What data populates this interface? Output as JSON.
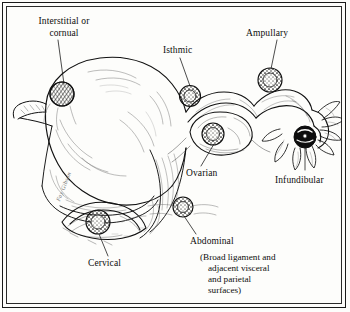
{
  "figure": {
    "medium": "pen-and-ink anatomical line drawing",
    "frame": {
      "style": "double-rule rectangle",
      "color": "#1a1a1a"
    },
    "ink_color": "#111111",
    "paper_color": "#fdfdfb",
    "signature": "Fay Gibson"
  },
  "labels": {
    "interstitial": "Interstitial or\ncornual",
    "isthmic": "Isthmic",
    "ampullary": "Ampullary",
    "infundibular": "Infundibular",
    "ovarian": "Ovarian",
    "abdominal": "Abdominal",
    "cervical": "Cervical"
  },
  "note": {
    "line1": "(Broad ligament and",
    "line2": "adjacent visceral",
    "line3": "and parietal",
    "line4": "surfaces)"
  },
  "sites": [
    {
      "key": "interstitial",
      "label": "Interstitial or cornual",
      "marker_style": "cross-hatched circle",
      "marker": {
        "cx": 62,
        "cy": 94,
        "r": 12
      },
      "leader": {
        "x1": 58,
        "y1": 40,
        "x2": 64,
        "y2": 84
      }
    },
    {
      "key": "isthmic",
      "label": "Isthmic",
      "marker_style": "stippled ring",
      "marker": {
        "cx": 190,
        "cy": 96,
        "r": 10.5
      },
      "leader": {
        "x1": 180,
        "y1": 58,
        "x2": 190,
        "y2": 86
      }
    },
    {
      "key": "ampullary",
      "label": "Ampullary",
      "marker_style": "stippled ring",
      "marker": {
        "cx": 270,
        "cy": 80,
        "r": 12
      },
      "leader": {
        "x1": 277,
        "y1": 40,
        "x2": 271,
        "y2": 69
      }
    },
    {
      "key": "infundibular",
      "label": "Infundibular",
      "marker_style": "solid dark blot",
      "marker": {
        "cx": 305,
        "cy": 137,
        "r": 11
      },
      "leader": {
        "x1": 305,
        "y1": 148,
        "x2": 305,
        "y2": 170
      }
    },
    {
      "key": "ovarian",
      "label": "Ovarian",
      "marker_style": "stippled ring",
      "marker": {
        "cx": 213,
        "cy": 134,
        "r": 11
      },
      "leader": {
        "x1": 214,
        "y1": 144,
        "x2": 201,
        "y2": 166
      }
    },
    {
      "key": "abdominal",
      "label": "Abdominal",
      "marker_style": "stippled ring",
      "marker": {
        "cx": 183,
        "cy": 207,
        "r": 10
      },
      "leader": {
        "x1": 184,
        "y1": 216,
        "x2": 196,
        "y2": 234
      }
    },
    {
      "key": "cervical",
      "label": "Cervical",
      "marker_style": "stippled ring",
      "marker": {
        "cx": 98,
        "cy": 222,
        "r": 12
      },
      "leader": {
        "x1": 99,
        "y1": 234,
        "x2": 108,
        "y2": 256
      }
    }
  ]
}
